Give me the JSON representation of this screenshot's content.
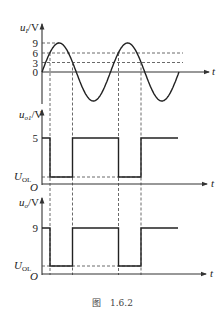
{
  "figure": {
    "caption_prefix": "图",
    "caption_number": "1.6.2"
  },
  "panels": [
    {
      "id": "input",
      "ylabel_var": "u",
      "ylabel_sub": "I",
      "ylabel_unit": "/V",
      "xlabel": "t",
      "ticks": [
        {
          "label": "9",
          "value": 9
        },
        {
          "label": "6",
          "value": 6
        },
        {
          "label": "3",
          "value": 3
        },
        {
          "label": "0",
          "value": 0
        }
      ]
    },
    {
      "id": "output1",
      "ylabel_var": "u",
      "ylabel_sub": "o1",
      "ylabel_unit": "/V",
      "xlabel": "t",
      "origin_label": "O",
      "high_label": "5",
      "low_label_var": "U",
      "low_label_sub": "OL"
    },
    {
      "id": "output",
      "ylabel_var": "u",
      "ylabel_sub": "o",
      "ylabel_unit": "/V",
      "xlabel": "t",
      "origin_label": "O",
      "high_label": "9",
      "low_label_var": "U",
      "low_label_sub": "OL"
    }
  ],
  "chart_data": [
    {
      "type": "line",
      "title": "Input sine wave u_I",
      "ylabel": "u_I/V",
      "xlabel": "t",
      "amplitude": 9,
      "periods": 2,
      "reference_levels": [
        9,
        6,
        3,
        0
      ],
      "thresholds": {
        "upper": 6,
        "lower": 3
      }
    },
    {
      "type": "line",
      "title": "Comparator output u_o1",
      "ylabel": "u_o1/V",
      "xlabel": "t",
      "levels": {
        "high": 5,
        "low": "U_OL"
      },
      "sequence": [
        "high",
        "low",
        "high",
        "low",
        "high"
      ]
    },
    {
      "type": "line",
      "title": "Output u_o",
      "ylabel": "u_o/V",
      "xlabel": "t",
      "levels": {
        "high": 9,
        "low": "U_OL"
      },
      "sequence": [
        "high",
        "low",
        "high",
        "low",
        "high"
      ]
    }
  ]
}
